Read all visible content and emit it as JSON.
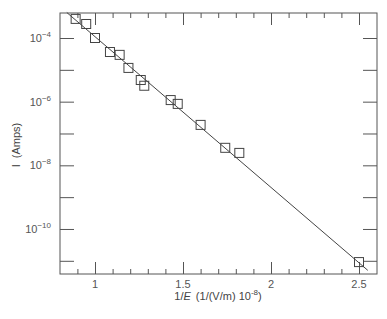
{
  "chart_data": {
    "type": "scatter",
    "title": "",
    "xlabel": "1/E (1/(V/m) 10^-8)",
    "ylabel": "I (Amps)",
    "x_scale": "linear",
    "y_scale": "log",
    "xlim": [
      0.8,
      2.6
    ],
    "ylim_log10": [
      -11.4,
      -3.2
    ],
    "x_ticks": [
      1,
      1.5,
      2,
      2.5
    ],
    "x_tick_labels": [
      "1",
      "1.5",
      "2",
      "2.5"
    ],
    "y_ticks_log10": [
      -4,
      -6,
      -8,
      -10
    ],
    "y_tick_labels": [
      "10^-4",
      "10^-6",
      "10^-8",
      "10^-10"
    ],
    "grid": false,
    "legend": null,
    "series": [
      {
        "name": "data",
        "marker": "open-square",
        "x": [
          0.89,
          0.95,
          1.0,
          1.085,
          1.14,
          1.19,
          1.26,
          1.28,
          1.43,
          1.47,
          1.6,
          1.74,
          1.82,
          2.5
        ],
        "y_log10": [
          -3.4,
          -3.56,
          -4.0,
          -4.44,
          -4.53,
          -4.94,
          -5.32,
          -5.5,
          -5.95,
          -6.07,
          -6.73,
          -7.45,
          -7.61,
          -11.04
        ]
      },
      {
        "name": "fit",
        "type": "line",
        "x": [
          0.84,
          2.55
        ],
        "y_log10": [
          -3.2,
          -11.3
        ]
      }
    ]
  },
  "labels": {
    "xlabel_prefix": "1/",
    "xlabel_E": "E",
    "xlabel_units": "(1/(V/m) 10",
    "xlabel_exp": "-8",
    "xlabel_close": ")",
    "ylabel_I": "I",
    "ylabel_units": "(Amps)"
  }
}
